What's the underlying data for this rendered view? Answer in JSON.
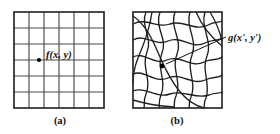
{
  "figure": {
    "width": 280,
    "height": 134,
    "background_color": "#ffffff",
    "line_color": "#4a4a4a",
    "frame_color": "#2b2b2b",
    "warp_color": "#1f1f1f",
    "text_color": "#111111"
  },
  "panel_a": {
    "caption": "(a)",
    "caption_x": 60,
    "caption_y": 124,
    "label": "f(x, y)",
    "label_x": 46,
    "label_y": 58,
    "frame": {
      "x": 14,
      "y": 12,
      "width": 90,
      "height": 96
    },
    "grid": {
      "columns": 6,
      "rows": 6
    },
    "dot": {
      "x": 39,
      "y": 60,
      "r": 2.1
    }
  },
  "panel_b": {
    "caption": "(b)",
    "caption_x": 177,
    "caption_y": 124,
    "label": "g(x', y')",
    "label_x": 228,
    "label_y": 41,
    "frame": {
      "x": 133,
      "y": 12,
      "width": 89,
      "height": 96
    },
    "dot": {
      "x": 162,
      "y": 66,
      "r": 2.4
    },
    "leader": {
      "x1": 166,
      "y1": 64,
      "x2": 226,
      "y2": 37
    },
    "warp_paths_u": [
      "M 133 24 C 146 17, 158 29, 170 24 C 183 19, 195 32, 208 25 C 215 21, 219 23, 222 21",
      "M 133 40 C 145 33, 155 47, 168 41 C 181 35, 192 50, 205 43 C 213 39, 218 41, 222 38",
      "M 133 57 C 144 51, 154 66, 167 60 C 180 54, 191 69, 204 62 C 212 58, 218 61, 222 57",
      "M 133 74 C 144 69, 155 84, 168 78 C 181 72, 192 86, 205 80 C 213 76, 218 79, 222 75",
      "M 133 91 C 145 86, 157 99, 170 94 C 183 89, 196 100, 209 95 C 216 92, 219 94, 222 92"
    ],
    "warp_paths_v": [
      "M 146 12 C 140 26, 153 38, 147 52 C 141 66, 152 80, 146 94 C 143 101, 145 105, 144 108",
      "M 160 12 C 154 27, 168 39, 162 53 C 156 67, 167 81, 161 95 C 158 102, 160 105, 159 108",
      "M 175 12 C 169 27, 183 40, 177 54 C 171 68, 182 82, 176 96 C 173 102, 175 106, 174 108",
      "M 190 12 C 185 27, 198 40, 192 55 C 186 69, 197 83, 191 97 C 188 103, 190 106, 189 108",
      "M 205 12 C 200 28, 213 41, 207 56 C 201 70, 211 84, 206 98 C 203 103, 205 106, 204 108"
    ],
    "warp_paths_extra": [
      "M 133 16 C 142 22, 150 34, 156 48 C 163 64, 170 80, 181 93 C 189 102, 196 106, 204 108",
      "M 152 12 C 150 28, 144 44, 138 58 C 134 68, 133 76, 133 84",
      "M 196 12 C 202 26, 212 38, 222 46",
      "M 133 100 C 146 104, 160 106, 174 107",
      "M 210 12 C 216 22, 220 32, 222 41"
    ]
  }
}
